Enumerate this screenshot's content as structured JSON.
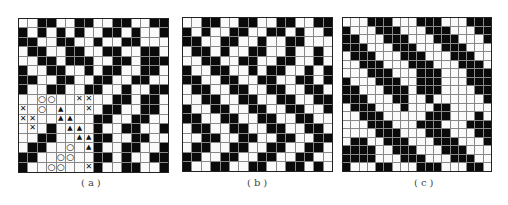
{
  "figure": {
    "panels": [
      {
        "id": "a",
        "label": "(a)",
        "size": 16,
        "legend_markers": {
          "X": "cross",
          "O": "circle",
          "T": "triangle"
        },
        "rows": [
          "WWBBWWBBWWBBWWBB",
          "BWBWBWBWWBBWBWWB",
          "BBWWBBWWBWWBBWWW",
          "WBBWWBBWWBBWWBBW",
          "WWBBWBBBWWBBWBBB",
          "BWWBBWWBWBBWWBBW",
          "BBWWBBWWBBWWBBWW",
          "BWWBBWWBBWWBWWBB",
          "WWOOWWXXWWBBWBBW",
          "XWOWTWWXWBBWWBBW",
          "XXWWTTWWBBWWBBWW",
          "WXWBWTTWBWWBBWWB",
          "WWBBWWTTBBWWBBWW",
          "WBBWWOWTBWWBBWWB",
          "BBWWOOWWBBWBWWBB",
          "BWWOOWWXBWWBBWWB"
        ]
      },
      {
        "id": "b",
        "label": "(b)",
        "size": 16,
        "rows": [
          "WWBBWWBBWWBBWWBB",
          "BWBWWBBWWBBWBWWB",
          "BBWWBBWWBWWBBWWW",
          "WBBWBWWBBWWBWWBW",
          "WWBBWWBBWWBBWWBW",
          "BWWBBWWBWBBWWBWB",
          "BBWWBBWWBBWWBBWB",
          "WBBWWBBWWBBWWBBW",
          "WWBBWWBBWWBBWWBB",
          "BWWBBWWBBWWBBWWB",
          "BBWWBBWWBBWWBBWW",
          "WBBWWBBWWBBWWBBW",
          "WWBBWWBBWWBBWWBB",
          "WBBWWBBWWBBWWBBW",
          "BBWWBBWWBBWWBBWW",
          "BWWBBWWBBWWBBWBW"
        ]
      },
      {
        "id": "c",
        "label": "(c)",
        "size": 18,
        "rows": [
          "WWWBBBWWWBBBWWWBBB",
          "BWWWBBBWWWBBBWWWBB",
          "BBWWWBBBWWWBBBWWWB",
          "BBBWWWBBBWWWBBBWWW",
          "WBBBWWWBBBWWWBBBWW",
          "WWBBBWWWBBBWWWBBBW",
          "WWWBBBWWWBBBWWWBBB",
          "BWWWBBBWWBBBWWWBBB",
          "BBWWWBBBWBBBWWWWBB",
          "BBBWWWBBWWBWWWWWWB",
          "WBBBWWWBWWWBBWWWWW",
          "WWBBBWWWWWBBBWWWBW",
          "WWWBBBWWWBBBWWWBBB",
          "WWWWBBBWWWBBBWWWBB",
          "WBBWWBBBWWWBBBWWWB",
          "BBBBWWBBBWWWBBBWWW",
          "BBBBWWWBBBWWWBBBWW",
          "BWWWBBWWWBBBWWWBBW"
        ]
      }
    ]
  }
}
